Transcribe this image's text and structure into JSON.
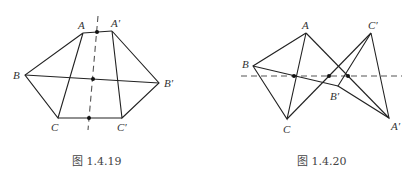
{
  "figures": [
    {
      "caption": "图 1.4.19",
      "labels": {
        "A": "A",
        "A_prime": "A′",
        "B": "B",
        "B_prime": "B′",
        "C": "C",
        "C_prime": "C′"
      }
    },
    {
      "caption": "图 1.4.20",
      "labels": {
        "A": "A",
        "A_prime": "A′",
        "B": "B",
        "B_prime": "B′",
        "C": "C",
        "C_prime": "C′"
      }
    }
  ],
  "colors": {
    "line": "#222222",
    "dash": "#555555",
    "text": "#333333"
  }
}
